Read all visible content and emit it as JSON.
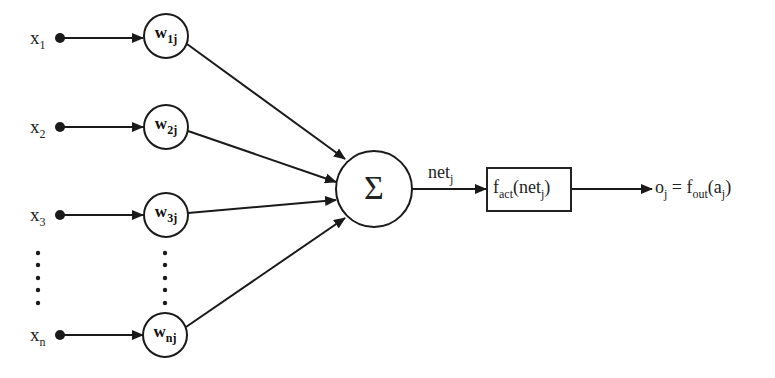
{
  "inputs": [
    {
      "label": "x",
      "sub": "1"
    },
    {
      "label": "x",
      "sub": "2"
    },
    {
      "label": "x",
      "sub": "3"
    },
    {
      "label": "x",
      "sub": "n"
    }
  ],
  "weights": [
    {
      "label": "w",
      "sub": "1j"
    },
    {
      "label": "w",
      "sub": "2j"
    },
    {
      "label": "w",
      "sub": "3j"
    },
    {
      "label": "w",
      "sub": "nj"
    }
  ],
  "summation": {
    "symbol": "Σ"
  },
  "net": {
    "label": "net",
    "sub": "j"
  },
  "activation": {
    "f": "f",
    "sub": "act",
    "arg_open": "(net",
    "arg_sub": "j",
    "arg_close": ")"
  },
  "output": {
    "o": "o",
    "o_sub": "j",
    "eq": " = f",
    "f_sub": "out",
    "arg_open": "(a",
    "arg_sub": "j",
    "arg_close": ")"
  },
  "ellipsis": {
    "dots": 5
  }
}
